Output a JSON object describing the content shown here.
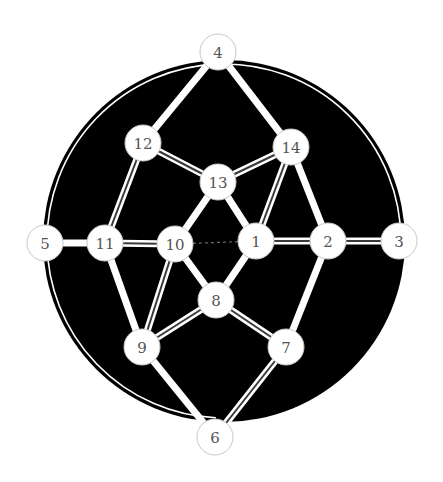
{
  "diagram": {
    "title": "",
    "colors": {
      "background": "#ffffff",
      "disc": "#000000",
      "edge": "#ffffff",
      "edge_inner": "#3a3a3a",
      "dashed_edge": "#6a6a6a",
      "node_fill": "#ffffff",
      "node_stroke": "#c8c8c8",
      "label": "#555555"
    },
    "nodes": [
      {
        "id": "1",
        "label": "1"
      },
      {
        "id": "2",
        "label": "2"
      },
      {
        "id": "3",
        "label": "3"
      },
      {
        "id": "4",
        "label": "4"
      },
      {
        "id": "5",
        "label": "5"
      },
      {
        "id": "6",
        "label": "6"
      },
      {
        "id": "7",
        "label": "7"
      },
      {
        "id": "8",
        "label": "8"
      },
      {
        "id": "9",
        "label": "9"
      },
      {
        "id": "10",
        "label": "10"
      },
      {
        "id": "11",
        "label": "11"
      },
      {
        "id": "12",
        "label": "12"
      },
      {
        "id": "13",
        "label": "13"
      },
      {
        "id": "14",
        "label": "14"
      }
    ],
    "edges": [
      {
        "from": "4",
        "to": "12",
        "style": "single"
      },
      {
        "from": "4",
        "to": "14",
        "style": "single"
      },
      {
        "from": "14",
        "to": "2",
        "style": "single"
      },
      {
        "from": "13",
        "to": "10",
        "style": "single"
      },
      {
        "from": "13",
        "to": "1",
        "style": "single"
      },
      {
        "from": "10",
        "to": "8",
        "style": "single"
      },
      {
        "from": "1",
        "to": "8",
        "style": "single"
      },
      {
        "from": "11",
        "to": "9",
        "style": "single"
      },
      {
        "from": "9",
        "to": "6",
        "style": "single"
      },
      {
        "from": "2",
        "to": "7",
        "style": "single"
      },
      {
        "from": "5",
        "to": "11",
        "style": "single"
      },
      {
        "from": "12",
        "to": "13",
        "style": "double"
      },
      {
        "from": "13",
        "to": "14",
        "style": "double"
      },
      {
        "from": "12",
        "to": "11",
        "style": "double"
      },
      {
        "from": "14",
        "to": "1",
        "style": "double"
      },
      {
        "from": "11",
        "to": "10",
        "style": "double"
      },
      {
        "from": "1",
        "to": "2",
        "style": "double"
      },
      {
        "from": "2",
        "to": "3",
        "style": "double"
      },
      {
        "from": "10",
        "to": "9",
        "style": "double"
      },
      {
        "from": "9",
        "to": "8",
        "style": "double"
      },
      {
        "from": "8",
        "to": "7",
        "style": "double"
      },
      {
        "from": "7",
        "to": "6",
        "style": "double"
      },
      {
        "from": "10",
        "to": "1",
        "style": "dashed"
      }
    ],
    "outer_arcs": [
      {
        "from": "4",
        "to": "3",
        "style": "double"
      },
      {
        "from": "4",
        "to": "5",
        "style": "double"
      },
      {
        "from": "5",
        "to": "6",
        "style": "double"
      },
      {
        "from": "3",
        "to": "6",
        "style": "none"
      }
    ]
  }
}
